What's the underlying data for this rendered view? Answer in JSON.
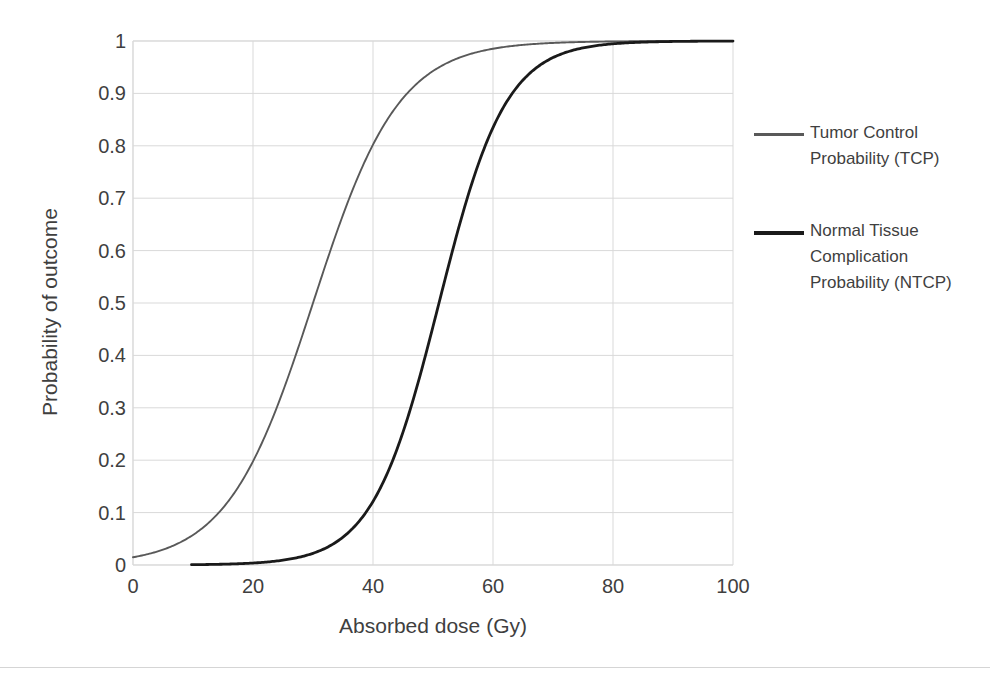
{
  "chart_data": {
    "type": "line",
    "title": "",
    "xlabel": "Absorbed dose (Gy)",
    "ylabel": "Probability of outcome",
    "xlim": [
      0,
      100
    ],
    "ylim": [
      0,
      1
    ],
    "xticks": [
      "0",
      "20",
      "40",
      "60",
      "80",
      "100"
    ],
    "yticks": [
      "0",
      "0.1",
      "0.2",
      "0.3",
      "0.4",
      "0.5",
      "0.6",
      "0.7",
      "0.8",
      "0.9",
      "1"
    ],
    "grid": true,
    "legend_position": "right",
    "x": [
      0,
      5,
      10,
      15,
      20,
      22,
      25,
      28,
      30,
      32,
      35,
      38,
      40,
      45,
      50,
      52,
      55,
      60,
      65,
      70,
      75,
      80,
      85,
      90,
      100
    ],
    "series": [
      {
        "name": "Tumor Control Probability (TCP)",
        "color": "#595959",
        "d50": 30,
        "values": [
          0.0,
          0.002,
          0.008,
          0.031,
          0.12,
          0.18,
          0.31,
          0.43,
          0.5,
          0.59,
          0.72,
          0.83,
          0.88,
          0.96,
          0.988,
          0.992,
          0.996,
          0.999,
          1.0,
          1.0,
          1.0,
          1.0,
          1.0,
          1.0,
          1.0
        ]
      },
      {
        "name": "Normal Tissue Complication Probability (NTCP)",
        "color": "#1a1a1a",
        "d50": 51,
        "values": [
          0.0,
          0.0,
          0.0,
          0.0,
          0.0,
          0.002,
          0.006,
          0.012,
          0.02,
          0.035,
          0.07,
          0.12,
          0.17,
          0.32,
          0.47,
          0.56,
          0.7,
          0.88,
          0.96,
          0.99,
          0.998,
          1.0,
          1.0,
          1.0,
          1.0
        ]
      }
    ]
  },
  "axes": {
    "x_title": "Absorbed dose (Gy)",
    "y_title": "Probability of outcome",
    "x_ticks": [
      "0",
      "20",
      "40",
      "60",
      "80",
      "100"
    ],
    "y_ticks": [
      "1",
      "0.9",
      "0.8",
      "0.7",
      "0.6",
      "0.5",
      "0.4",
      "0.3",
      "0.2",
      "0.1",
      "0"
    ]
  },
  "legend": {
    "items": [
      {
        "label_lines": [
          "Tumor Control",
          "Probability (TCP)"
        ],
        "color": "#595959"
      },
      {
        "label_lines": [
          "Normal Tissue",
          "Complication",
          "Probability (NTCP)"
        ],
        "color": "#1a1a1a"
      }
    ]
  },
  "colors": {
    "tcp_line": "#595959",
    "ntcp_line": "#1a1a1a",
    "grid": "#d9d9d9",
    "axis_text": "#3f3f3f",
    "background": "#ffffff"
  }
}
